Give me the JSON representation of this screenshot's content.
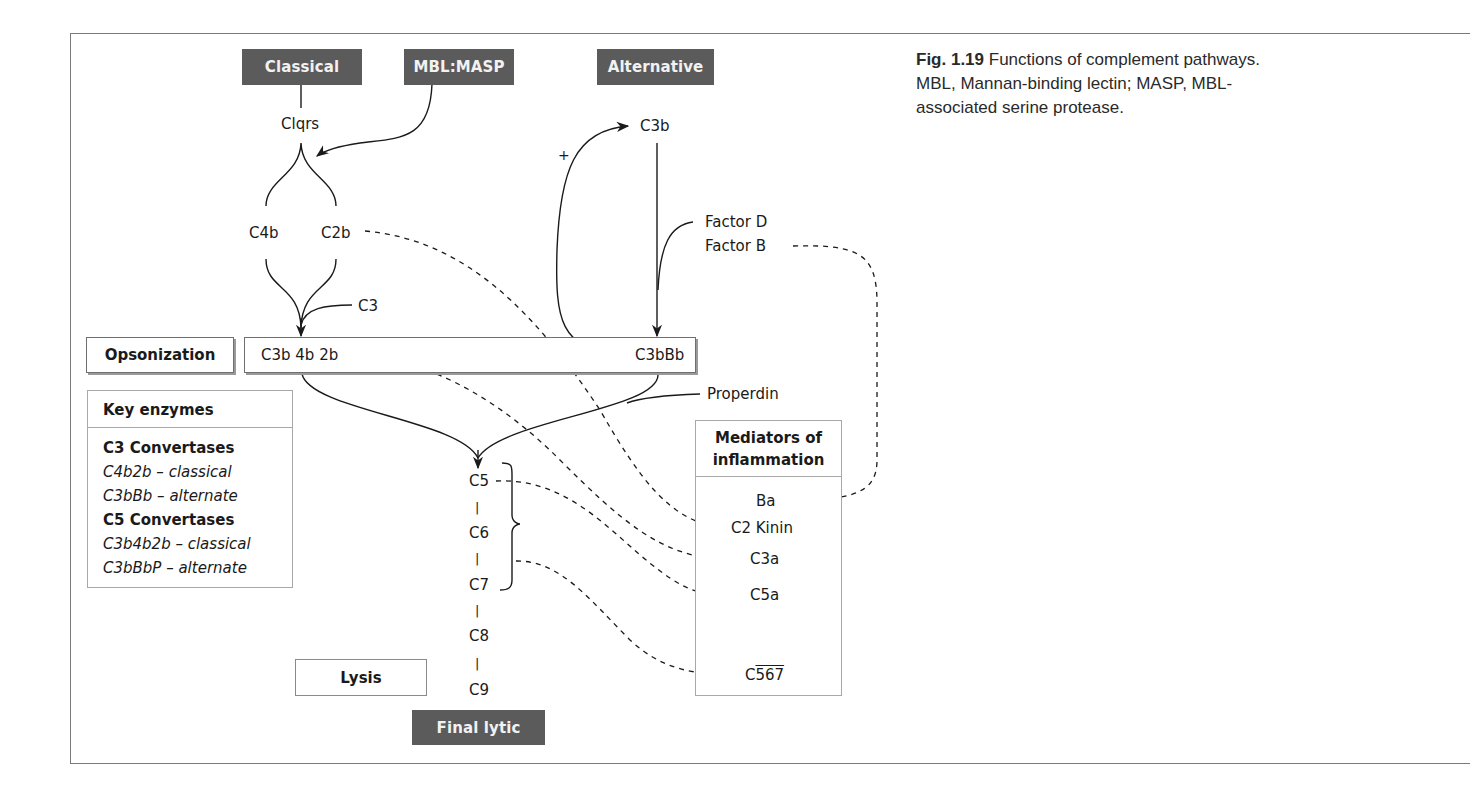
{
  "figure": {
    "caption": {
      "label": "Fig. 1.19",
      "text": "Functions of complement pathways. MBL, Mannan-binding lectin; MASP, MBL-associated serine protease."
    }
  },
  "pathways": {
    "classical": "Classical",
    "mbl_masp": "MBL:MASP",
    "alternative": "Alternative",
    "final_lytic": "Final lytic"
  },
  "nodes": {
    "c1qrs": "Clqrs",
    "c3b_top": "C3b",
    "plus": "+",
    "c4b": "C4b",
    "c2b": "C2b",
    "c3": "C3",
    "factor_d": "Factor D",
    "factor_b": "Factor B",
    "c3b4b2b": "C3b 4b 2b",
    "c3bbb": "C3bBb",
    "properdin": "Properdin",
    "c5": "C5",
    "c6": "C6",
    "c7": "C7",
    "c8": "C8",
    "c9": "C9",
    "dash1": "|",
    "dash2": "|",
    "dash3": "|",
    "dash4": "|"
  },
  "functions": {
    "opsonization": "Opsonization",
    "lysis": "Lysis"
  },
  "key_enzymes": {
    "title": "Key enzymes",
    "lines": [
      {
        "text": "C3 Convertases",
        "style": "bold"
      },
      {
        "text": "C4b2b – classical",
        "style": "italic"
      },
      {
        "text": "C3bBb – alternate",
        "style": "italic"
      },
      {
        "text": "C5 Convertases",
        "style": "bold"
      },
      {
        "text": "C3b4b2b –  classical",
        "style": "italic"
      },
      {
        "text": "C3bBbP – alternate",
        "style": "italic"
      }
    ]
  },
  "mediators": {
    "title_line1": "Mediators of",
    "title_line2": "inflammation",
    "items": {
      "ba": "Ba",
      "c2_kinin": "C2 Kinin",
      "c3a": "C3a",
      "c5a": "C5a",
      "c567_prefix": "C",
      "c567_overlined": "567"
    }
  },
  "colors": {
    "pathway_box": "#5b5b5b",
    "pathway_text": "#f2f2f2",
    "line": "#1a1a1a",
    "frame": "#7a7a7a",
    "box_border": "#a8a8a8"
  }
}
